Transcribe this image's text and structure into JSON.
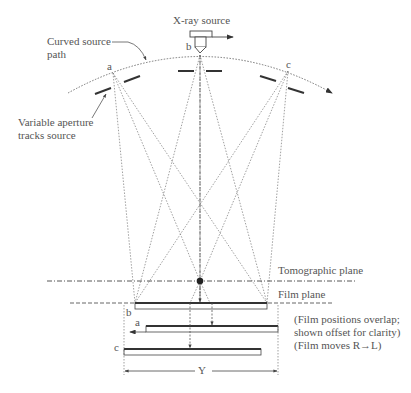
{
  "diagram": {
    "labels": {
      "xray_source": "X-ray source",
      "curved_path_line1": "Curved source",
      "curved_path_line2": "path",
      "aperture_line1": "Variable aperture",
      "aperture_line2": "tracks source",
      "pos_a": "a",
      "pos_b": "b",
      "pos_c": "c",
      "tomographic_plane": "Tomographic plane",
      "film_plane": "Film plane",
      "film_b": "b",
      "film_a": "a",
      "film_c": "c",
      "note_line1": "(Film positions overlap;",
      "note_line2": "shown offset for clarity)",
      "note_line3": "(Film moves R→L)",
      "dimension": "Y"
    },
    "colors": {
      "line": "#555555",
      "dark": "#333333",
      "text": "#555555"
    }
  }
}
